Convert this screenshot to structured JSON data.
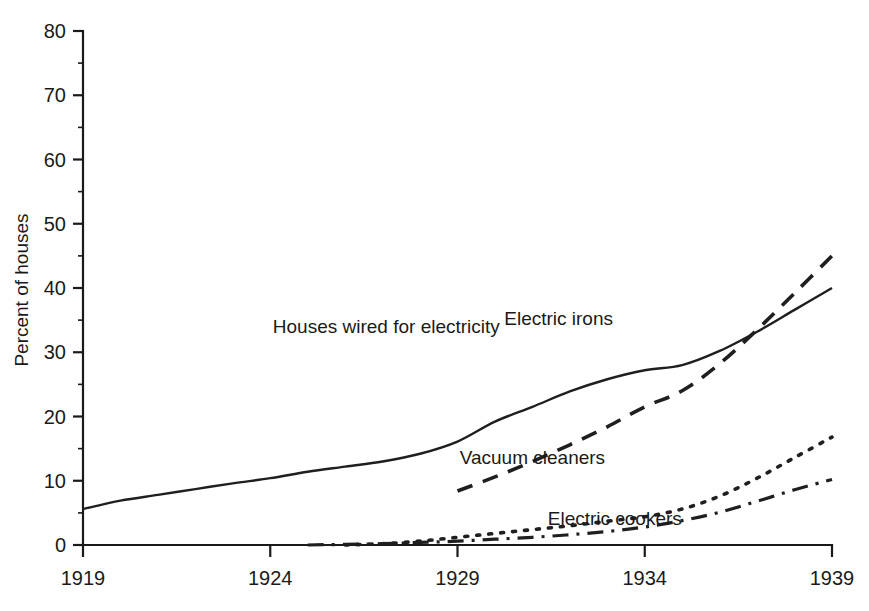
{
  "chart_data": {
    "type": "line",
    "title": "",
    "subtitle": "",
    "xlabel": "",
    "ylabel": "Percent of houses",
    "xlim": [
      1919,
      1939
    ],
    "ylim": [
      0,
      80
    ],
    "grid": false,
    "legend_position": "inline-annotations",
    "x_ticks": [
      "1919",
      "1924",
      "1929",
      "1934",
      "1939"
    ],
    "x_tick_values": [
      1919,
      1924,
      1929,
      1934,
      1939
    ],
    "y_ticks": [
      "0",
      "10",
      "20",
      "30",
      "40",
      "50",
      "60",
      "70",
      "80"
    ],
    "y_tick_values": [
      0,
      10,
      20,
      30,
      40,
      50,
      60,
      70,
      80
    ],
    "series": [
      {
        "name": "Houses wired for electricity",
        "style": "solid",
        "label_position": {
          "x": 1927.1,
          "y": 33.0
        },
        "x": [
          1919,
          1920,
          1921,
          1922,
          1923,
          1924,
          1925,
          1926,
          1927,
          1928,
          1929,
          1930,
          1931,
          1932,
          1933,
          1934,
          1935,
          1936,
          1937,
          1938,
          1939
        ],
        "values": [
          5.6,
          6.9,
          7.8,
          8.7,
          9.6,
          10.4,
          11.4,
          12.2,
          13.0,
          14.2,
          16.1,
          19.2,
          21.5,
          23.9,
          25.8,
          27.2,
          28.0,
          30.2,
          33.2,
          36.6,
          40.0
        ]
      },
      {
        "name": "Electric irons",
        "style": "dashed",
        "label_position": {
          "x": 1931.7,
          "y": 34.2
        },
        "x": [
          1929,
          1930,
          1931,
          1932,
          1933,
          1934,
          1935,
          1936,
          1937,
          1938,
          1939
        ],
        "values": [
          8.4,
          10.6,
          13.0,
          15.6,
          18.4,
          21.5,
          24.0,
          28.2,
          33.5,
          39.2,
          45.0
        ]
      },
      {
        "name": "Vacuum cleaners",
        "style": "dotted",
        "label_position": {
          "x": 1931.0,
          "y": 12.6
        },
        "x": [
          1926,
          1927,
          1928,
          1929,
          1930,
          1931,
          1932,
          1933,
          1934,
          1935,
          1936,
          1937,
          1938,
          1939
        ],
        "values": [
          0.0,
          0.2,
          0.6,
          1.2,
          1.8,
          2.4,
          3.0,
          3.7,
          4.4,
          5.6,
          7.6,
          10.4,
          13.6,
          16.8
        ]
      },
      {
        "name": "Electric cookers",
        "style": "dash-dot",
        "label_position": {
          "x": 1933.2,
          "y": 3.1
        },
        "x": [
          1925,
          1926,
          1927,
          1928,
          1929,
          1930,
          1931,
          1932,
          1933,
          1934,
          1935,
          1936,
          1937,
          1938,
          1939
        ],
        "values": [
          0.0,
          0.1,
          0.2,
          0.4,
          0.6,
          0.9,
          1.2,
          1.6,
          2.1,
          2.8,
          3.8,
          5.1,
          6.8,
          8.6,
          10.2
        ]
      }
    ],
    "colors": {
      "line": "#1f1f1f",
      "axis": "#1a1a1a",
      "background": "#ffffff"
    }
  }
}
